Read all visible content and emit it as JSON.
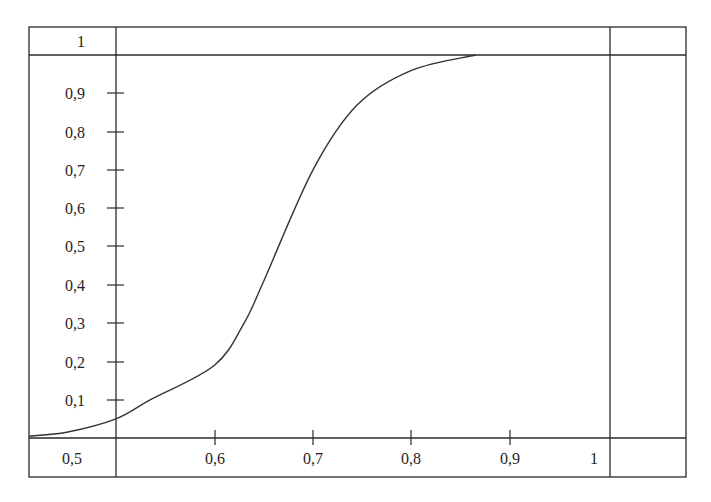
{
  "chart_data": {
    "type": "line",
    "title": "",
    "xlabel": "",
    "ylabel": "",
    "xlim": [
      0.412,
      1.0
    ],
    "ylim": [
      0,
      1
    ],
    "grid": false,
    "legend": null,
    "x_ticks": [
      "0,5",
      "0,6",
      "0,7",
      "0,8",
      "0,9",
      "1"
    ],
    "y_ticks": [
      "0,1",
      "0,2",
      "0,3",
      "0,4",
      "0,5",
      "0,6",
      "0,7",
      "0,8",
      "0,9",
      "1"
    ],
    "series": [
      {
        "name": "S-curve",
        "x": [
          0.412,
          0.45,
          0.5,
          0.535,
          0.6,
          0.63,
          0.65,
          0.7,
          0.745,
          0.8,
          0.865
        ],
        "y": [
          0.005,
          0.015,
          0.05,
          0.1,
          0.19,
          0.3,
          0.41,
          0.7,
          0.87,
          0.96,
          1.0
        ]
      }
    ]
  },
  "axes": {
    "y_top_label": "1",
    "y_labels": [
      "0,9",
      "0,8",
      "0,7",
      "0,6",
      "0,5",
      "0,4",
      "0,3",
      "0,2",
      "0,1"
    ],
    "x_corner_label": "0,5",
    "x_labels": [
      "0,6",
      "0,7",
      "0,8",
      "0,9",
      "1"
    ]
  }
}
